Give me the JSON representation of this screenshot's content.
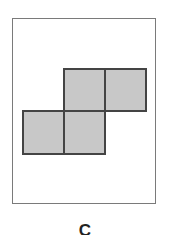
{
  "figure": {
    "label": "C",
    "fill_color": "#c8c8c8",
    "stroke_color": "#444444",
    "frame_color": "#7a7a7a",
    "cells": [
      {
        "row": 0,
        "col": 1
      },
      {
        "row": 0,
        "col": 2
      },
      {
        "row": 1,
        "col": 0
      },
      {
        "row": 1,
        "col": 1
      }
    ]
  }
}
